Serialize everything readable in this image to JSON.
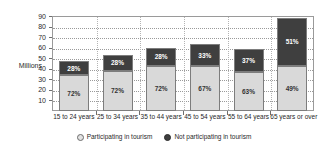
{
  "chart_data": {
    "type": "bar",
    "subtype": "stacked-bar-100-percent-labeled",
    "title": "",
    "xlabel": "",
    "ylabel": "Millions",
    "ylim": [
      0,
      90
    ],
    "ytick_step": 10,
    "yticks": [
      "90",
      "80",
      "70",
      "60",
      "50",
      "40",
      "30",
      "20",
      "10"
    ],
    "grid": true,
    "legend_position": "bottom",
    "categories": [
      "15 to 24 years",
      "25 to 34 years",
      "35 to 44 years",
      "45 to 54 years",
      "55 to 64 years",
      "65 years or over"
    ],
    "totals": [
      47,
      53,
      60,
      63.5,
      59,
      88
    ],
    "series": [
      {
        "name": "Participating in tourism",
        "color": "#d9d9d9",
        "values": [
          34,
          38,
          43,
          42.5,
          37,
          43
        ],
        "percent_labels": [
          "72%",
          "72%",
          "72%",
          "67%",
          "63%",
          "49%"
        ]
      },
      {
        "name": "Not participating in tourism",
        "color": "#3f3f3f",
        "values": [
          13,
          15,
          17,
          21,
          22,
          45
        ],
        "percent_labels": [
          "28%",
          "28%",
          "28%",
          "33%",
          "37%",
          "51%"
        ]
      }
    ]
  },
  "legend": {
    "items": [
      {
        "label": "Participating in tourism",
        "swatch": "light-circle-icon"
      },
      {
        "label": "Not participating in tourism",
        "swatch": "dark-circle-icon"
      }
    ]
  }
}
